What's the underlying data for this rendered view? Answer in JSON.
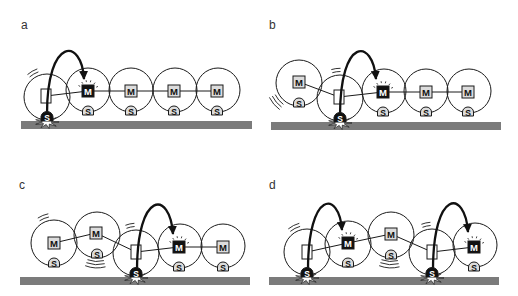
{
  "figure": {
    "width": 518,
    "height": 296,
    "colors": {
      "background": "#ffffff",
      "stroke": "#1a1a1a",
      "ground": "#7b7b7b",
      "module_fill": "#dcdcdc",
      "active_fill": "#111111",
      "active_text": "#ffffff",
      "anchor_body_fill": "#ffffff",
      "burst_fill": "#ffffff"
    },
    "glyphs": {
      "motor": "M",
      "sensor": "S"
    },
    "legend": {
      "body_types": {
        "anchor": "empty frame (anchored module)",
        "active": "black M (actuating motor)",
        "idle": "grey M (idle motor)"
      },
      "foot_types": {
        "anchor": "black S (sensor in ground contact)",
        "passive": "grey S (sensor)"
      }
    },
    "panels": [
      {
        "label": "a",
        "label_x": 21,
        "label_y": 29,
        "ground": {
          "x": 21,
          "y": 121,
          "w": 231,
          "h": 8
        },
        "units": [
          {
            "cx": 47,
            "cy": 97,
            "r": 23,
            "body": {
              "type": "anchor",
              "x": 46,
              "y": 96
            },
            "foot": {
              "type": "anchor",
              "x": 47,
              "y": 117
            },
            "motion": {
              "angle": 240,
              "span": 11,
              "count": 2
            }
          },
          {
            "cx": 88,
            "cy": 90,
            "r": 22,
            "body": {
              "type": "active",
              "x": 88,
              "y": 91
            },
            "foot": {
              "type": "passive",
              "x": 88,
              "y": 111
            }
          },
          {
            "cx": 131,
            "cy": 90,
            "r": 22,
            "body": {
              "type": "idle",
              "x": 131,
              "y": 91
            },
            "foot": {
              "type": "passive",
              "x": 131,
              "y": 111
            }
          },
          {
            "cx": 175,
            "cy": 90,
            "r": 22,
            "body": {
              "type": "idle",
              "x": 174,
              "y": 91
            },
            "foot": {
              "type": "passive",
              "x": 174,
              "y": 111
            }
          },
          {
            "cx": 218,
            "cy": 90,
            "r": 22,
            "body": {
              "type": "idle",
              "x": 217,
              "y": 91
            },
            "foot": {
              "type": "passive",
              "x": 217,
              "y": 111
            }
          }
        ],
        "arrows": [
          {
            "from": [
              47,
              114
            ],
            "c1": [
              47,
              36
            ],
            "c2": [
              82,
              38
            ],
            "to": [
              84,
              79
            ]
          }
        ]
      },
      {
        "label": "b",
        "label_x": 269,
        "label_y": 29,
        "ground": {
          "x": 271,
          "y": 122,
          "w": 230,
          "h": 8
        },
        "units": [
          {
            "cx": 299,
            "cy": 83,
            "r": 23,
            "body": {
              "type": "idle",
              "x": 299,
              "y": 82
            },
            "foot": {
              "type": "passive",
              "x": 299,
              "y": 103
            },
            "motion": {
              "angle": 140,
              "span": 14,
              "count": 3
            }
          },
          {
            "cx": 340,
            "cy": 98,
            "r": 23,
            "body": {
              "type": "anchor",
              "x": 339,
              "y": 97
            },
            "foot": {
              "type": "anchor",
              "x": 340,
              "y": 118
            },
            "motion": {
              "angle": 262,
              "span": 9,
              "count": 2
            }
          },
          {
            "cx": 384,
            "cy": 91,
            "r": 22,
            "body": {
              "type": "active",
              "x": 383,
              "y": 92
            },
            "foot": {
              "type": "passive",
              "x": 383,
              "y": 112
            }
          },
          {
            "cx": 426,
            "cy": 91,
            "r": 22,
            "body": {
              "type": "idle",
              "x": 426,
              "y": 92
            },
            "foot": {
              "type": "passive",
              "x": 426,
              "y": 112
            }
          },
          {
            "cx": 469,
            "cy": 91,
            "r": 22,
            "body": {
              "type": "idle",
              "x": 468,
              "y": 92
            },
            "foot": {
              "type": "passive",
              "x": 468,
              "y": 112
            }
          }
        ],
        "arrows": [
          {
            "from": [
              340,
              116
            ],
            "c1": [
              340,
              36
            ],
            "c2": [
              373,
              38
            ],
            "to": [
              376,
              79
            ]
          }
        ]
      },
      {
        "label": "c",
        "label_x": 19,
        "label_y": 189,
        "ground": {
          "x": 20,
          "y": 277,
          "w": 230,
          "h": 8
        },
        "units": [
          {
            "cx": 54,
            "cy": 243,
            "r": 23,
            "body": {
              "type": "idle",
              "x": 54,
              "y": 243
            },
            "foot": {
              "type": "passive",
              "x": 54,
              "y": 263
            },
            "motion": {
              "angle": 248,
              "span": 11,
              "count": 2
            }
          },
          {
            "cx": 97,
            "cy": 235,
            "r": 23,
            "body": {
              "type": "idle",
              "x": 96,
              "y": 233
            },
            "foot": {
              "type": "passive",
              "x": 97,
              "y": 254
            },
            "motion": {
              "angle": 93,
              "span": 18,
              "count": 3
            }
          },
          {
            "cx": 136,
            "cy": 253,
            "r": 23,
            "body": {
              "type": "anchor",
              "x": 136,
              "y": 252
            },
            "foot": {
              "type": "anchor",
              "x": 136,
              "y": 273
            },
            "motion": {
              "angle": 258,
              "span": 9,
              "count": 2
            }
          },
          {
            "cx": 180,
            "cy": 246,
            "r": 22,
            "body": {
              "type": "active",
              "x": 179,
              "y": 247
            },
            "foot": {
              "type": "passive",
              "x": 179,
              "y": 267
            }
          },
          {
            "cx": 223,
            "cy": 246,
            "r": 22,
            "body": {
              "type": "idle",
              "x": 223,
              "y": 247
            },
            "foot": {
              "type": "passive",
              "x": 223,
              "y": 267
            }
          }
        ],
        "arrows": [
          {
            "from": [
              137,
              271
            ],
            "c1": [
              137,
              190
            ],
            "c2": [
              170,
              190
            ],
            "to": [
              173,
              234
            ]
          }
        ]
      },
      {
        "label": "d",
        "label_x": 269,
        "label_y": 189,
        "ground": {
          "x": 269,
          "y": 277,
          "w": 230,
          "h": 8
        },
        "units": [
          {
            "cx": 307,
            "cy": 252,
            "r": 23,
            "body": {
              "type": "anchor",
              "x": 307,
              "y": 252
            },
            "foot": {
              "type": "anchor",
              "x": 307,
              "y": 273
            },
            "motion": {
              "angle": 243,
              "span": 12,
              "count": 2
            }
          },
          {
            "cx": 348,
            "cy": 244,
            "r": 23,
            "body": {
              "type": "active",
              "x": 348,
              "y": 243
            },
            "foot": {
              "type": "passive",
              "x": 348,
              "y": 263
            }
          },
          {
            "cx": 391,
            "cy": 235,
            "r": 23,
            "body": {
              "type": "idle",
              "x": 391,
              "y": 234
            },
            "foot": {
              "type": "passive",
              "x": 391,
              "y": 255
            },
            "motion": {
              "angle": 93,
              "span": 18,
              "count": 3
            }
          },
          {
            "cx": 432,
            "cy": 252,
            "r": 23,
            "body": {
              "type": "anchor",
              "x": 432,
              "y": 252
            },
            "foot": {
              "type": "anchor",
              "x": 432,
              "y": 273
            },
            "motion": {
              "angle": 258,
              "span": 9,
              "count": 2
            }
          },
          {
            "cx": 475,
            "cy": 245,
            "r": 22,
            "body": {
              "type": "active",
              "x": 474,
              "y": 247
            },
            "foot": {
              "type": "passive",
              "x": 474,
              "y": 267
            }
          }
        ],
        "arrows": [
          {
            "from": [
              308,
              270
            ],
            "c1": [
              308,
              190
            ],
            "c2": [
              339,
              190
            ],
            "to": [
              342,
              230
            ]
          },
          {
            "from": [
              433,
              270
            ],
            "c1": [
              433,
              189
            ],
            "c2": [
              465,
              189
            ],
            "to": [
              468,
              232
            ]
          }
        ]
      }
    ]
  }
}
